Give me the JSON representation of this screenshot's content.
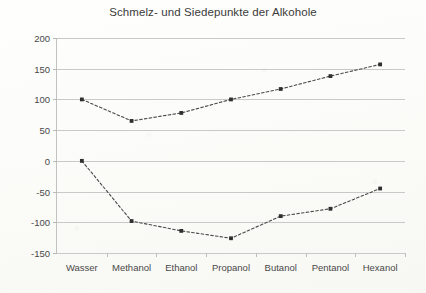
{
  "chart_data": {
    "type": "line",
    "title": "Schmelz- und Siedepunkte der Alkohole",
    "xlabel": "",
    "ylabel": "",
    "ylim": [
      -150,
      200
    ],
    "ytick_step": 50,
    "yticks": [
      200,
      150,
      100,
      50,
      0,
      -50,
      -100,
      -150
    ],
    "grid": true,
    "legend": "none",
    "categories": [
      "Wasser",
      "Methanol",
      "Ethanol",
      "Propanol",
      "Butanol",
      "Pentanol",
      "Hexanol"
    ],
    "series": [
      {
        "name": "Siedepunkt",
        "values": [
          100,
          65,
          78,
          100,
          117,
          138,
          157
        ]
      },
      {
        "name": "Schmelzpunkt",
        "values": [
          0,
          -98,
          -114,
          -126,
          -90,
          -78,
          -45
        ]
      }
    ]
  },
  "style": {
    "line_color": "#4a4a4a",
    "marker_color": "#2f2f2f",
    "grid_color": "#c9c9c9",
    "text_color": "#494949",
    "title_color": "#3b3b3b",
    "background": "#fdfdfb"
  }
}
